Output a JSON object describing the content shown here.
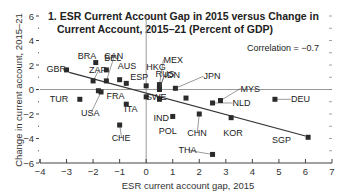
{
  "chart_data": {
    "type": "scatter",
    "title": "1. ESR Current Account Gap in 2015 versus Change in Current Account, 2015–21 (Percent of GDP)",
    "title_lines": [
      "1. ESR Current Account Gap in 2015 versus Change in",
      "Current Account, 2015–21 (Percent of GDP)"
    ],
    "xlabel": "ESR current account gap, 2015",
    "ylabel": "Change in current account, 2015–21",
    "xlim": [
      -4,
      7
    ],
    "ylim": [
      -6,
      6
    ],
    "xticks": [
      -4,
      -3,
      -2,
      -1,
      0,
      1,
      2,
      3,
      4,
      5,
      6,
      7
    ],
    "yticks": [
      -6,
      -4,
      -2,
      0,
      2,
      4,
      6
    ],
    "grid": false,
    "annotation": "Correlation = −0.7",
    "trendline": {
      "x": [
        -2.9,
        6.0
      ],
      "y": [
        1.4,
        -3.8
      ]
    },
    "points": [
      {
        "label": "GBR",
        "x": -3.0,
        "y": 1.6
      },
      {
        "label": "BRA",
        "x": -1.9,
        "y": 2.2
      },
      {
        "label": "BEL",
        "x": -1.5,
        "y": 1.6
      },
      {
        "label": "ZAF",
        "x": -2.0,
        "y": 0.7
      },
      {
        "label": "CAN",
        "x": -1.5,
        "y": 0.7
      },
      {
        "label": "AUS",
        "x": -1.0,
        "y": 0.8
      },
      {
        "label": "ESP",
        "x": -0.75,
        "y": 0.5
      },
      {
        "label": "FRA",
        "x": -1.8,
        "y": -0.1
      },
      {
        "label": "USA",
        "x": -1.7,
        "y": -0.2
      },
      {
        "label": "TUR",
        "x": -2.5,
        "y": -0.8
      },
      {
        "label": "ITA",
        "x": -0.75,
        "y": -1.2
      },
      {
        "label": "CHE",
        "x": -1.0,
        "y": -2.9
      },
      {
        "label": "HKG",
        "x": 0.0,
        "y": 0.3
      },
      {
        "label": "MEX",
        "x": 0.5,
        "y": 0.4
      },
      {
        "label": "RUS",
        "x": 0.5,
        "y": 0.2
      },
      {
        "label": "IDN",
        "x": 0.5,
        "y": 0.0
      },
      {
        "label": "JPN",
        "x": 1.1,
        "y": 0.1
      },
      {
        "label": "",
        "x": 0.0,
        "y": -0.6
      },
      {
        "label": "IND",
        "x": 0.5,
        "y": -0.8
      },
      {
        "label": "POL",
        "x": 1.0,
        "y": -2.2
      },
      {
        "label": "SWE",
        "x": 1.5,
        "y": -0.7
      },
      {
        "label": "CHN",
        "x": 2.0,
        "y": -2.0
      },
      {
        "label": "THA",
        "x": 2.5,
        "y": -5.3
      },
      {
        "label": "NLD",
        "x": 2.5,
        "y": -1.1
      },
      {
        "label": "MYS",
        "x": 2.8,
        "y": -0.9
      },
      {
        "label": "KOR",
        "x": 3.2,
        "y": -2.3
      },
      {
        "label": "DEU",
        "x": 4.85,
        "y": -0.8
      },
      {
        "label": "SGP",
        "x": 6.1,
        "y": -3.9
      }
    ]
  },
  "colors": {
    "marker": "#2b2b2b",
    "axis": "#444444",
    "trendline": "#333333",
    "zero_lines": "#999999",
    "text": "#222222"
  }
}
